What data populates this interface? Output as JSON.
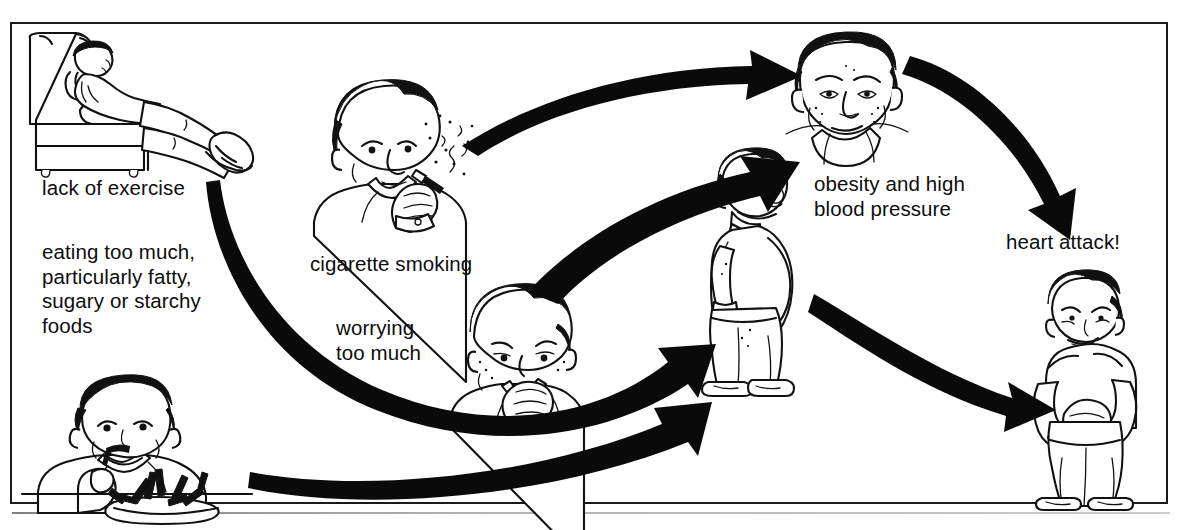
{
  "diagram": {
    "frame": {
      "border_color": "#1a1a1a",
      "background": "#ffffff"
    },
    "labels": {
      "lack_of_exercise": "lack of exercise",
      "eating_too_much": "eating too much,\nparticularly fatty,\nsugary or starchy\nfoods",
      "cigarette_smoking": "cigarette smoking",
      "worrying_too_much": "worrying\ntoo much",
      "obesity_high_bp": "obesity and high\nblood pressure",
      "heart_attack": "heart attack!"
    },
    "illustrations": [
      {
        "name": "man-lounging-in-armchair",
        "label_key": "lack_of_exercise"
      },
      {
        "name": "man-eating-plate-of-food",
        "label_key": "eating_too_much"
      },
      {
        "name": "man-smoking-cigarette",
        "label_key": "cigarette_smoking"
      },
      {
        "name": "worried-man-hand-over-mouth",
        "label_key": "worrying_too_much"
      },
      {
        "name": "obese-man-standing-side-view",
        "label_key": "obesity_high_bp"
      },
      {
        "name": "round-face-high-blood-pressure",
        "label_key": "obesity_high_bp"
      },
      {
        "name": "man-clutching-chest-heart-attack",
        "label_key": "heart_attack"
      }
    ],
    "arrows": [
      {
        "name": "arrow-smoking-to-obesity",
        "from": "cigarette_smoking",
        "to": "obesity_high_bp"
      },
      {
        "name": "arrow-worrying-to-obesity",
        "from": "worrying_too_much",
        "to": "obesity_high_bp"
      },
      {
        "name": "arrow-lack-of-exercise-to-obese-man",
        "from": "lack_of_exercise",
        "to": "obesity_high_bp"
      },
      {
        "name": "arrow-eating-to-obese-man",
        "from": "eating_too_much",
        "to": "obesity_high_bp"
      },
      {
        "name": "arrow-head-to-heart-attack",
        "from": "obesity_high_bp",
        "to": "heart_attack"
      },
      {
        "name": "arrow-obese-man-to-heart-attack",
        "from": "obesity_high_bp",
        "to": "heart_attack"
      }
    ],
    "colors": {
      "ink": "#111111",
      "paper": "#ffffff",
      "arrow": "#0a0a0a"
    }
  }
}
